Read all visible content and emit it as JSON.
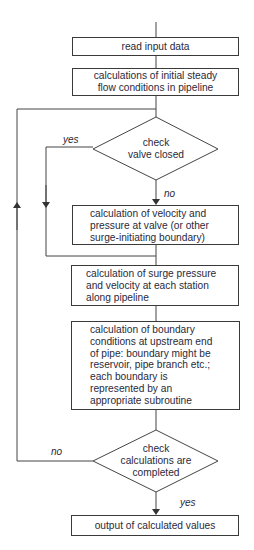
{
  "flowchart": {
    "steps": {
      "read_input": "read input data",
      "initial_steady_line1": "calculations of initial steady",
      "initial_steady_line2": "flow conditions in pipeline",
      "check_valve_line1": "check",
      "check_valve_line2": "valve closed",
      "velocity_pressure_line1": "calculation of velocity and",
      "velocity_pressure_line2": "pressure at valve (or other",
      "velocity_pressure_line3": "surge-initiating boundary)",
      "surge_line1": "calculation of surge pressure",
      "surge_line2": "and velocity at each station",
      "surge_line3": "along pipeline",
      "boundary_line1": "calculation of boundary",
      "boundary_line2": "conditions at upstream end",
      "boundary_line3": "of pipe: boundary might be",
      "boundary_line4": "reservoir, pipe branch etc.;",
      "boundary_line5": "each boundary is",
      "boundary_line6": "represented by an",
      "boundary_line7": "appropriate subroutine",
      "check_complete_line1": "check",
      "check_complete_line2": "calculations are",
      "check_complete_line3": "completed",
      "output": "output of calculated values"
    },
    "labels": {
      "valve_yes": "yes",
      "valve_no": "no",
      "complete_no": "no",
      "complete_yes": "yes"
    }
  }
}
